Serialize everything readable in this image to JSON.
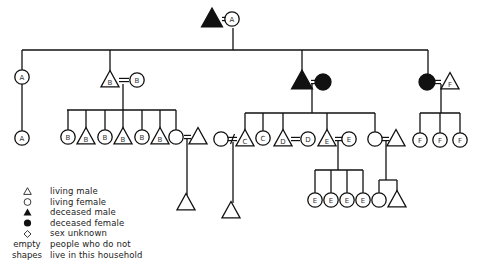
{
  "diagram": {
    "type": "kinship-genealogy",
    "colors": {
      "ink": "#111111",
      "background": "#ffffff"
    },
    "nodes": [
      {
        "id": "g0m",
        "shape": "triangle",
        "filled": true,
        "x": 212,
        "y": 19,
        "label": ""
      },
      {
        "id": "g0f",
        "shape": "circle",
        "filled": false,
        "x": 232,
        "y": 19,
        "label": "A"
      },
      {
        "id": "g1a",
        "shape": "circle",
        "filled": false,
        "x": 22,
        "y": 77,
        "label": "A"
      },
      {
        "id": "g1bm",
        "shape": "triangle",
        "filled": false,
        "x": 110,
        "y": 80,
        "label": "B"
      },
      {
        "id": "g1bf",
        "shape": "circle",
        "filled": false,
        "x": 137,
        "y": 80,
        "label": "B"
      },
      {
        "id": "g1cm",
        "shape": "triangle",
        "filled": true,
        "x": 302,
        "y": 81,
        "label": ""
      },
      {
        "id": "g1cf",
        "shape": "circle",
        "filled": true,
        "x": 323,
        "y": 82,
        "label": ""
      },
      {
        "id": "g1df",
        "shape": "circle",
        "filled": true,
        "x": 427,
        "y": 82,
        "label": ""
      },
      {
        "id": "g1dm",
        "shape": "triangle",
        "filled": false,
        "x": 450,
        "y": 82,
        "label": "F"
      },
      {
        "id": "g2a",
        "shape": "circle",
        "filled": false,
        "x": 22,
        "y": 138,
        "label": "A"
      },
      {
        "id": "g2b1",
        "shape": "circle",
        "filled": false,
        "x": 68,
        "y": 137,
        "label": "B"
      },
      {
        "id": "g2b2",
        "shape": "triangle",
        "filled": false,
        "x": 86,
        "y": 137,
        "label": "B"
      },
      {
        "id": "g2b3",
        "shape": "circle",
        "filled": false,
        "x": 105,
        "y": 137,
        "label": "B"
      },
      {
        "id": "g2b4",
        "shape": "triangle",
        "filled": false,
        "x": 123,
        "y": 137,
        "label": "B"
      },
      {
        "id": "g2b5",
        "shape": "circle",
        "filled": false,
        "x": 142,
        "y": 137,
        "label": "B"
      },
      {
        "id": "g2b6",
        "shape": "triangle",
        "filled": false,
        "x": 160,
        "y": 137,
        "label": "B"
      },
      {
        "id": "g2b7",
        "shape": "circle",
        "filled": false,
        "x": 176,
        "y": 137,
        "label": ""
      },
      {
        "id": "g2b7s",
        "shape": "triangle",
        "filled": false,
        "x": 198,
        "y": 137,
        "label": ""
      },
      {
        "id": "g2c0",
        "shape": "circle",
        "filled": false,
        "x": 221,
        "y": 139,
        "label": ""
      },
      {
        "id": "g2c1",
        "shape": "triangle",
        "filled": false,
        "x": 245,
        "y": 139,
        "label": "C"
      },
      {
        "id": "g2c2",
        "shape": "circle",
        "filled": false,
        "x": 263,
        "y": 138,
        "label": "C"
      },
      {
        "id": "g2c3",
        "shape": "triangle",
        "filled": false,
        "x": 283,
        "y": 139,
        "label": "D"
      },
      {
        "id": "g2c3s",
        "shape": "circle",
        "filled": false,
        "x": 308,
        "y": 139,
        "label": "D"
      },
      {
        "id": "g2c4",
        "shape": "triangle",
        "filled": false,
        "x": 327,
        "y": 139,
        "label": "E"
      },
      {
        "id": "g2c4s",
        "shape": "circle",
        "filled": false,
        "x": 349,
        "y": 139,
        "label": "E"
      },
      {
        "id": "g2c5",
        "shape": "circle",
        "filled": false,
        "x": 375,
        "y": 139,
        "label": ""
      },
      {
        "id": "g2c5s",
        "shape": "triangle",
        "filled": false,
        "x": 396,
        "y": 139,
        "label": ""
      },
      {
        "id": "g2d1",
        "shape": "circle",
        "filled": false,
        "x": 420,
        "y": 140,
        "label": "F"
      },
      {
        "id": "g2d2",
        "shape": "circle",
        "filled": false,
        "x": 440,
        "y": 140,
        "label": "F"
      },
      {
        "id": "g2d3",
        "shape": "circle",
        "filled": false,
        "x": 460,
        "y": 140,
        "label": "F"
      },
      {
        "id": "g3b",
        "shape": "triangle",
        "filled": false,
        "x": 186,
        "y": 203,
        "label": ""
      },
      {
        "id": "g3c",
        "shape": "triangle",
        "filled": false,
        "x": 231,
        "y": 211,
        "label": ""
      },
      {
        "id": "g3e1",
        "shape": "circle",
        "filled": false,
        "x": 315,
        "y": 200,
        "label": "E"
      },
      {
        "id": "g3e2",
        "shape": "circle",
        "filled": false,
        "x": 331,
        "y": 200,
        "label": "E"
      },
      {
        "id": "g3e3",
        "shape": "circle",
        "filled": false,
        "x": 347,
        "y": 200,
        "label": "E"
      },
      {
        "id": "g3e4",
        "shape": "circle",
        "filled": false,
        "x": 363,
        "y": 200,
        "label": "E"
      },
      {
        "id": "g3f1",
        "shape": "circle",
        "filled": false,
        "x": 379,
        "y": 200,
        "label": ""
      },
      {
        "id": "g3f2",
        "shape": "triangle",
        "filled": false,
        "x": 397,
        "y": 200,
        "label": ""
      }
    ],
    "marriages": [
      {
        "x1": 222,
        "x2": 226,
        "y": 19,
        "type": "married"
      },
      {
        "x1": 119,
        "x2": 129,
        "y": 80,
        "type": "married"
      },
      {
        "x1": 311,
        "x2": 316,
        "y": 82,
        "type": "married"
      },
      {
        "x1": 434,
        "x2": 441,
        "y": 82,
        "type": "married"
      },
      {
        "x1": 184,
        "x2": 191,
        "y": 137,
        "type": "married"
      },
      {
        "x1": 228,
        "x2": 237,
        "y": 139,
        "type": "divorced"
      },
      {
        "x1": 291,
        "x2": 300,
        "y": 139,
        "type": "married"
      },
      {
        "x1": 335,
        "x2": 342,
        "y": 139,
        "type": "married"
      },
      {
        "x1": 382,
        "x2": 389,
        "y": 139,
        "type": "married"
      }
    ],
    "lines": [
      [
        233,
        28,
        233,
        50
      ],
      [
        22,
        50,
        428,
        50
      ],
      [
        22,
        50,
        22,
        70
      ],
      [
        110,
        50,
        110,
        72
      ],
      [
        302,
        50,
        302,
        72
      ],
      [
        428,
        50,
        428,
        75
      ],
      [
        22,
        84,
        22,
        131
      ],
      [
        123,
        84,
        123,
        110
      ],
      [
        67,
        110,
        176,
        110
      ],
      [
        68,
        110,
        68,
        130
      ],
      [
        86,
        110,
        86,
        130
      ],
      [
        105,
        110,
        105,
        130
      ],
      [
        123,
        110,
        123,
        130
      ],
      [
        142,
        110,
        142,
        130
      ],
      [
        160,
        110,
        160,
        130
      ],
      [
        176,
        110,
        176,
        130
      ],
      [
        187,
        139,
        187,
        195
      ],
      [
        312,
        84,
        312,
        113
      ],
      [
        245,
        113,
        375,
        113
      ],
      [
        245,
        113,
        245,
        131
      ],
      [
        263,
        113,
        263,
        131
      ],
      [
        283,
        113,
        283,
        131
      ],
      [
        327,
        113,
        327,
        131
      ],
      [
        375,
        113,
        375,
        132
      ],
      [
        233,
        142,
        233,
        203
      ],
      [
        338,
        141,
        338,
        170
      ],
      [
        315,
        170,
        363,
        170
      ],
      [
        315,
        170,
        315,
        193
      ],
      [
        331,
        170,
        331,
        193
      ],
      [
        347,
        170,
        347,
        193
      ],
      [
        363,
        170,
        363,
        193
      ],
      [
        386,
        141,
        386,
        180
      ],
      [
        379,
        180,
        397,
        180
      ],
      [
        379,
        180,
        379,
        193
      ],
      [
        397,
        180,
        397,
        193
      ],
      [
        441,
        84,
        441,
        113
      ],
      [
        420,
        113,
        460,
        113
      ],
      [
        420,
        113,
        420,
        133
      ],
      [
        440,
        113,
        440,
        133
      ],
      [
        460,
        113,
        460,
        133
      ]
    ]
  },
  "legend": {
    "items": [
      {
        "symbol": "triangle-open",
        "label": "living male"
      },
      {
        "symbol": "circle-open",
        "label": "living female"
      },
      {
        "symbol": "triangle-filled",
        "label": "deceased male"
      },
      {
        "symbol": "circle-filled",
        "label": "deceased female"
      },
      {
        "symbol": "diamond-open",
        "label": "sex unknown"
      }
    ],
    "note_key_line1": "empty",
    "note_key_line2": "shapes",
    "note_text_line1": "people who do not",
    "note_text_line2": "live in this household"
  }
}
